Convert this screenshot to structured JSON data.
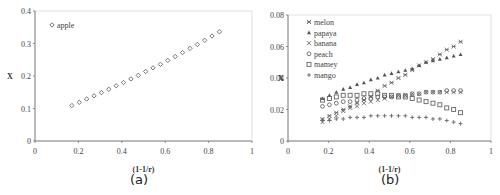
{
  "chart_data": [
    {
      "type": "scatter",
      "caption": "(a)",
      "title": "",
      "xlabel": "(1-1/r)",
      "ylabel": "X",
      "xlim": [
        0,
        1
      ],
      "ylim": [
        0,
        0.4
      ],
      "xticks": [
        "0",
        "0.2",
        "0.4",
        "0.6",
        "0.8",
        "1"
      ],
      "yticks": [
        "0",
        "0.1",
        "0.2",
        "0.3",
        "0.4"
      ],
      "legend_position": "upper-left",
      "x": [
        0.17,
        0.204,
        0.238,
        0.272,
        0.306,
        0.34,
        0.374,
        0.408,
        0.442,
        0.476,
        0.51,
        0.544,
        0.578,
        0.612,
        0.646,
        0.68,
        0.714,
        0.748,
        0.782,
        0.816,
        0.85
      ],
      "series": [
        {
          "name": "apple",
          "marker": "diamond",
          "values": [
            0.109,
            0.119,
            0.129,
            0.139,
            0.149,
            0.159,
            0.17,
            0.18,
            0.191,
            0.202,
            0.214,
            0.225,
            0.236,
            0.248,
            0.26,
            0.272,
            0.285,
            0.297,
            0.31,
            0.323,
            0.336
          ]
        }
      ]
    },
    {
      "type": "scatter",
      "caption": "(b)",
      "title": "",
      "xlabel": "(1-1/r)",
      "ylabel": "X",
      "xlim": [
        0,
        1
      ],
      "ylim": [
        0,
        0.08
      ],
      "xticks": [
        "0",
        "0.2",
        "0.4",
        "0.6",
        "0.8",
        "1"
      ],
      "yticks": [
        "0",
        "0.02",
        "0.04",
        "0.06",
        "0.08"
      ],
      "legend_position": "upper-left",
      "x": [
        0.17,
        0.204,
        0.238,
        0.272,
        0.306,
        0.34,
        0.374,
        0.408,
        0.442,
        0.476,
        0.51,
        0.544,
        0.578,
        0.612,
        0.646,
        0.68,
        0.714,
        0.748,
        0.782,
        0.816,
        0.85
      ],
      "series": [
        {
          "name": "melon",
          "marker": "asterisk",
          "values": [
            0.014,
            0.016,
            0.018,
            0.02,
            0.022,
            0.024,
            0.026,
            0.028,
            0.032,
            0.035,
            0.037,
            0.04,
            0.042,
            0.045,
            0.048,
            0.05,
            0.052,
            0.055,
            0.058,
            0.06,
            0.063
          ]
        },
        {
          "name": "papaya",
          "marker": "triangle",
          "values": [
            0.027,
            0.029,
            0.031,
            0.033,
            0.034,
            0.036,
            0.037,
            0.039,
            0.04,
            0.042,
            0.043,
            0.044,
            0.045,
            0.046,
            0.048,
            0.05,
            0.051,
            0.052,
            0.053,
            0.054,
            0.055
          ]
        },
        {
          "name": "banana",
          "marker": "x",
          "values": [
            0.012,
            0.014,
            0.016,
            0.019,
            0.021,
            0.022,
            0.024,
            0.025,
            0.026,
            0.027,
            0.028,
            0.029,
            0.029,
            0.03,
            0.03,
            0.031,
            0.031,
            0.031,
            0.031,
            0.031,
            0.031
          ]
        },
        {
          "name": "peach",
          "marker": "circle",
          "values": [
            0.022,
            0.023,
            0.024,
            0.025,
            0.025,
            0.026,
            0.027,
            0.027,
            0.028,
            0.028,
            0.028,
            0.029,
            0.029,
            0.03,
            0.03,
            0.031,
            0.031,
            0.031,
            0.032,
            0.032,
            0.032
          ]
        },
        {
          "name": "mamey",
          "marker": "square",
          "values": [
            0.026,
            0.027,
            0.028,
            0.029,
            0.029,
            0.029,
            0.03,
            0.03,
            0.03,
            0.029,
            0.029,
            0.028,
            0.028,
            0.027,
            0.026,
            0.025,
            0.024,
            0.023,
            0.021,
            0.02,
            0.018
          ]
        },
        {
          "name": "mango",
          "marker": "plus",
          "values": [
            0.013,
            0.013,
            0.014,
            0.014,
            0.015,
            0.015,
            0.015,
            0.016,
            0.016,
            0.016,
            0.016,
            0.016,
            0.016,
            0.015,
            0.015,
            0.015,
            0.014,
            0.014,
            0.013,
            0.012,
            0.011
          ]
        }
      ]
    }
  ]
}
